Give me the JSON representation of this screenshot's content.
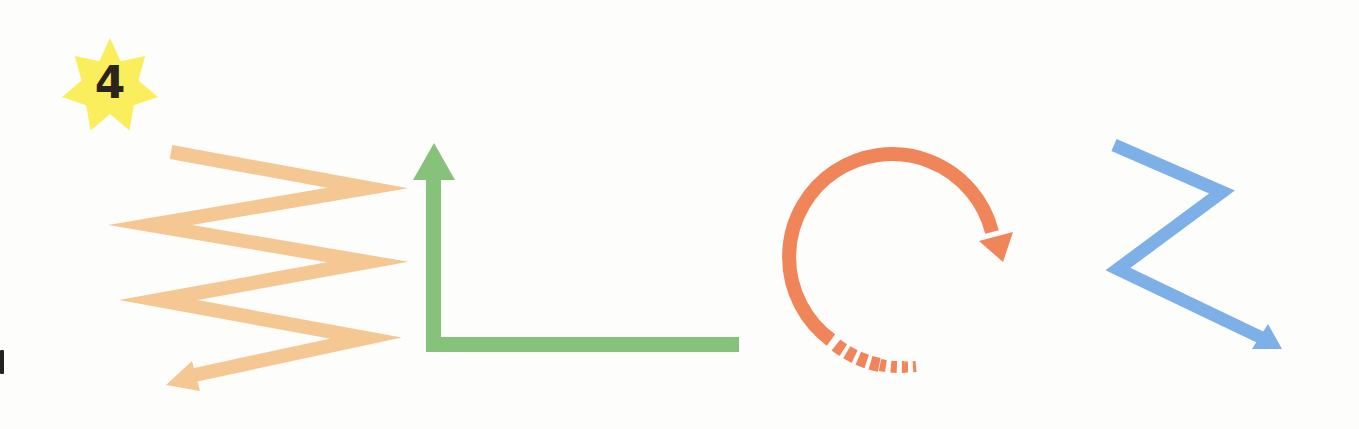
{
  "figure": {
    "step_badge": {
      "label": "4",
      "shape": "seven-point-star",
      "fill": "#fbee5c",
      "text_color": "#2b241c"
    },
    "arrows": [
      {
        "name": "zigzag-arrow",
        "description": "Zigzag arrow going down and ending pointing left",
        "color": "#f5c793",
        "direction": "down-left"
      },
      {
        "name": "l-shaped-arrow",
        "description": "L-shaped arrow from right along bottom then up",
        "color": "#86c27a",
        "direction": "up"
      },
      {
        "name": "circular-arrow",
        "description": "Clockwise circular arrow with dashed tail",
        "color": "#f1855a",
        "direction": "clockwise"
      },
      {
        "name": "z-shaped-arrow",
        "description": "Z-shaped arrow ending pointing down-right",
        "color": "#7eb0e8",
        "direction": "down-right"
      }
    ]
  }
}
